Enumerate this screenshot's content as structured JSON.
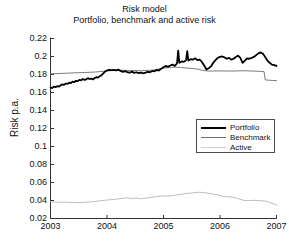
{
  "chart_data": {
    "type": "line",
    "title": "Risk model",
    "subtitle": "Portfolio, benchmark and active risk",
    "xlabel": "",
    "ylabel": "Risk p.a.",
    "xlim": [
      2003,
      2007
    ],
    "ylim": [
      0.02,
      0.22
    ],
    "xticks": [
      2003,
      2004,
      2005,
      2006,
      2007
    ],
    "xtick_labels": [
      "2003",
      "2004",
      "2005",
      "2006",
      "2007"
    ],
    "yticks": [
      0.02,
      0.04,
      0.06,
      0.08,
      0.1,
      0.12,
      0.14,
      0.16,
      0.18,
      0.2,
      0.22
    ],
    "ytick_labels": [
      "0.02",
      "0.04",
      "0.06",
      "0.08",
      "0.1",
      "0.12",
      "0.14",
      "0.16",
      "0.18",
      "0.2",
      "0.22"
    ],
    "grid": false,
    "legend_position": "center-right",
    "colors": {
      "portfolio": "#000000",
      "benchmark": "#6e6e6e",
      "active": "#bdbdbd"
    },
    "series": [
      {
        "name": "Portfolio",
        "color": "#000000",
        "linewidth": 1.8,
        "x": [
          2003.0,
          2003.03,
          2003.06,
          2003.09,
          2003.12,
          2003.15,
          2003.18,
          2003.21,
          2003.24,
          2003.27,
          2003.3,
          2003.33,
          2003.36,
          2003.39,
          2003.42,
          2003.45,
          2003.48,
          2003.51,
          2003.54,
          2003.57,
          2003.6,
          2003.63,
          2003.66,
          2003.69,
          2003.72,
          2003.75,
          2003.78,
          2003.81,
          2003.84,
          2003.87,
          2003.9,
          2003.93,
          2003.96,
          2004.0,
          2004.04,
          2004.08,
          2004.12,
          2004.16,
          2004.2,
          2004.24,
          2004.28,
          2004.32,
          2004.36,
          2004.4,
          2004.44,
          2004.48,
          2004.52,
          2004.56,
          2004.6,
          2004.64,
          2004.68,
          2004.72,
          2004.76,
          2004.8,
          2004.84,
          2004.88,
          2004.92,
          2004.96,
          2005.0,
          2005.04,
          2005.08,
          2005.12,
          2005.16,
          2005.2,
          2005.24,
          2005.26,
          2005.28,
          2005.32,
          2005.36,
          2005.4,
          2005.42,
          2005.44,
          2005.48,
          2005.52,
          2005.56,
          2005.6,
          2005.64,
          2005.68,
          2005.72,
          2005.76,
          2005.8,
          2005.84,
          2005.88,
          2005.92,
          2005.96,
          2006.0,
          2006.04,
          2006.08,
          2006.12,
          2006.16,
          2006.2,
          2006.24,
          2006.28,
          2006.32,
          2006.36,
          2006.4,
          2006.44,
          2006.48,
          2006.52,
          2006.56,
          2006.6,
          2006.64,
          2006.68,
          2006.72,
          2006.76,
          2006.8,
          2006.84,
          2006.88,
          2006.92,
          2006.96,
          2007.0
        ],
        "y": [
          0.1655,
          0.165,
          0.1665,
          0.166,
          0.167,
          0.1665,
          0.168,
          0.169,
          0.1685,
          0.17,
          0.1695,
          0.171,
          0.1705,
          0.172,
          0.1715,
          0.173,
          0.1725,
          0.174,
          0.1735,
          0.175,
          0.174,
          0.1745,
          0.176,
          0.175,
          0.1755,
          0.1745,
          0.176,
          0.177,
          0.1765,
          0.178,
          0.179,
          0.181,
          0.183,
          0.1845,
          0.185,
          0.1848,
          0.1852,
          0.1845,
          0.1855,
          0.184,
          0.183,
          0.1838,
          0.1825,
          0.182,
          0.1832,
          0.1818,
          0.1825,
          0.1815,
          0.1822,
          0.1812,
          0.182,
          0.183,
          0.1825,
          0.184,
          0.1835,
          0.185,
          0.1845,
          0.1865,
          0.188,
          0.1895,
          0.1885,
          0.19,
          0.191,
          0.1895,
          0.1925,
          0.2065,
          0.193,
          0.1945,
          0.194,
          0.196,
          0.206,
          0.1955,
          0.197,
          0.1965,
          0.198,
          0.196,
          0.1965,
          0.194,
          0.19,
          0.1855,
          0.187,
          0.189,
          0.193,
          0.196,
          0.1985,
          0.1995,
          0.2,
          0.199,
          0.1975,
          0.1985,
          0.1965,
          0.1975,
          0.1995,
          0.201,
          0.1985,
          0.193,
          0.1955,
          0.198,
          0.1975,
          0.1985,
          0.1995,
          0.2015,
          0.2035,
          0.2045,
          0.203,
          0.1995,
          0.1955,
          0.193,
          0.191,
          0.1905,
          0.1895
        ]
      },
      {
        "name": "Benchmark",
        "color": "#6e6e6e",
        "linewidth": 0.9,
        "x": [
          2003.0,
          2003.2,
          2003.4,
          2003.6,
          2003.8,
          2004.0,
          2004.2,
          2004.4,
          2004.6,
          2004.8,
          2005.0,
          2005.1,
          2005.2,
          2005.3,
          2005.4,
          2005.5,
          2005.6,
          2005.7,
          2005.8,
          2006.0,
          2006.2,
          2006.4,
          2006.6,
          2006.7,
          2006.78,
          2006.8,
          2006.9,
          2007.0
        ],
        "y": [
          0.1808,
          0.1812,
          0.1818,
          0.1822,
          0.1828,
          0.184,
          0.1848,
          0.1845,
          0.1842,
          0.1848,
          0.187,
          0.1878,
          0.1882,
          0.1878,
          0.1872,
          0.1868,
          0.186,
          0.1845,
          0.1838,
          0.184,
          0.1838,
          0.1842,
          0.1838,
          0.1835,
          0.1832,
          0.174,
          0.1735,
          0.1732
        ]
      },
      {
        "name": "Active",
        "color": "#bdbdbd",
        "linewidth": 1.0,
        "x": [
          2003.0,
          2003.08,
          2003.16,
          2003.24,
          2003.32,
          2003.4,
          2003.48,
          2003.56,
          2003.64,
          2003.72,
          2003.8,
          2003.88,
          2003.96,
          2004.04,
          2004.12,
          2004.2,
          2004.28,
          2004.36,
          2004.44,
          2004.52,
          2004.6,
          2004.68,
          2004.76,
          2004.84,
          2004.92,
          2005.0,
          2005.08,
          2005.16,
          2005.24,
          2005.32,
          2005.4,
          2005.48,
          2005.56,
          2005.64,
          2005.72,
          2005.8,
          2005.88,
          2005.96,
          2006.04,
          2006.12,
          2006.2,
          2006.28,
          2006.36,
          2006.44,
          2006.52,
          2006.6,
          2006.68,
          2006.76,
          2006.84,
          2006.92,
          2007.0
        ],
        "y": [
          0.0388,
          0.0382,
          0.038,
          0.0383,
          0.0378,
          0.038,
          0.0376,
          0.0379,
          0.0382,
          0.0385,
          0.039,
          0.0398,
          0.0402,
          0.0408,
          0.0412,
          0.0418,
          0.0425,
          0.043,
          0.0422,
          0.0428,
          0.042,
          0.0426,
          0.0432,
          0.044,
          0.0448,
          0.0452,
          0.0448,
          0.0455,
          0.0462,
          0.047,
          0.0478,
          0.0482,
          0.0488,
          0.0492,
          0.0488,
          0.048,
          0.047,
          0.0462,
          0.0448,
          0.0442,
          0.0438,
          0.043,
          0.0412,
          0.04,
          0.0398,
          0.0402,
          0.04,
          0.0396,
          0.0388,
          0.0368,
          0.0352
        ]
      }
    ]
  },
  "legend": {
    "items": [
      {
        "label": "Portfolio"
      },
      {
        "label": "Benchmark"
      },
      {
        "label": "Active"
      }
    ]
  }
}
